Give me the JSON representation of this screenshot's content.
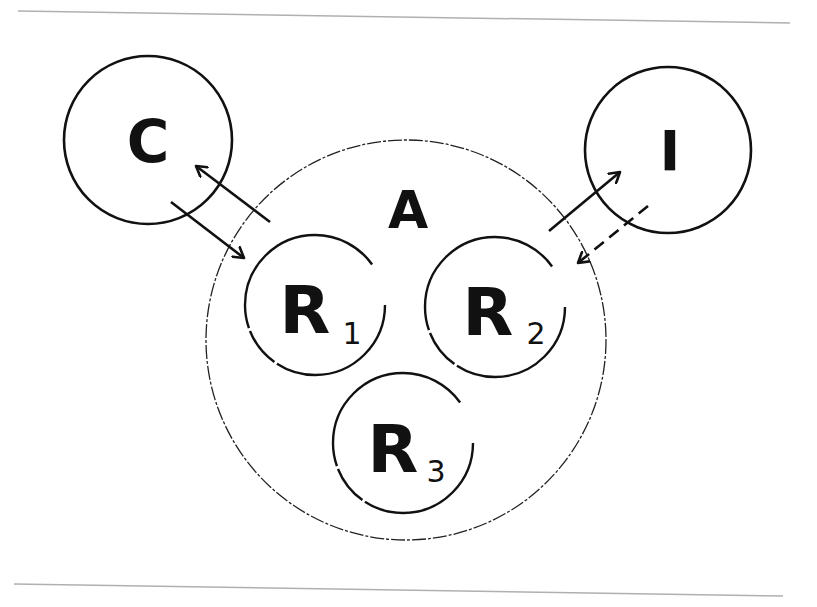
{
  "diagram": {
    "type": "venn-like agent-resource diagram",
    "nodes": {
      "C": {
        "label": "C",
        "shape": "circle",
        "cx": 148,
        "cy": 140,
        "r": 84,
        "border": "solid"
      },
      "I": {
        "label": "I",
        "shape": "circle",
        "cx": 668,
        "cy": 150,
        "r": 83,
        "border": "solid"
      },
      "A": {
        "label": "A",
        "shape": "circle",
        "cx": 406,
        "cy": 340,
        "r": 200,
        "border": "dashed-thin"
      },
      "R1": {
        "label": "R",
        "subscript": "1",
        "shape": "circle",
        "cx": 315,
        "cy": 305,
        "r": 70,
        "parent": "A"
      },
      "R2": {
        "label": "R",
        "subscript": "2",
        "shape": "circle",
        "cx": 495,
        "cy": 307,
        "r": 70,
        "parent": "A"
      },
      "R3": {
        "label": "R",
        "subscript": "3",
        "shape": "circle",
        "cx": 403,
        "cy": 443,
        "r": 70,
        "parent": "A"
      }
    },
    "edges": [
      {
        "from": "A",
        "to": "C",
        "style": "solid",
        "arrow": "end"
      },
      {
        "from": "C",
        "to": "R1",
        "style": "solid",
        "arrow": "end"
      },
      {
        "from": "A",
        "to": "I",
        "style": "solid",
        "arrow": "end"
      },
      {
        "from": "I",
        "to": "R2",
        "style": "dashed",
        "arrow": "end"
      }
    ],
    "rules": {
      "top_y": 18,
      "bottom_y": 586,
      "color": "#b0b0b0"
    },
    "stroke_color": "#111111"
  }
}
